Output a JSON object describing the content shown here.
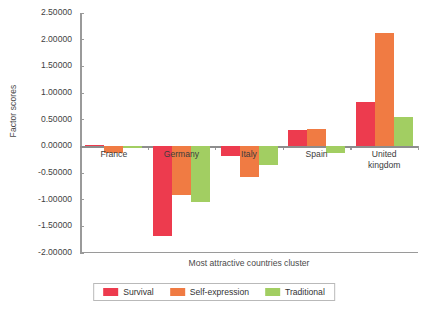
{
  "chart_data": {
    "type": "bar",
    "title": "",
    "xlabel": "Most attractive countries cluster",
    "ylabel": "Factor scores",
    "categories": [
      "France",
      "Germany",
      "Italy",
      "Spain",
      "United\nkingdom"
    ],
    "series": [
      {
        "name": "Survival",
        "color": "#ED3B4E",
        "values": [
          0.03,
          -1.68,
          -0.18,
          0.3,
          0.83
        ]
      },
      {
        "name": "Self-expression",
        "color": "#F07B43",
        "values": [
          -0.12,
          -0.91,
          -0.58,
          0.33,
          2.12
        ]
      },
      {
        "name": "Traditional",
        "color": "#A2CE62",
        "values": [
          -0.01,
          -1.05,
          -0.35,
          -0.12,
          0.55
        ]
      }
    ],
    "ylim": [
      -2.0,
      2.5
    ],
    "yticks": [
      2.5,
      2.0,
      1.5,
      1.0,
      0.5,
      0.0,
      -0.5,
      -1.0,
      -1.5,
      -2.0
    ],
    "ytick_labels": [
      "2.50000",
      "2.00000",
      "1.50000",
      "1.00000",
      "0.50000",
      "0.00000",
      "-0.50000",
      "-1.00000",
      "-1.50000",
      "-2.00000"
    ],
    "grid": false,
    "legend_position": "bottom"
  }
}
